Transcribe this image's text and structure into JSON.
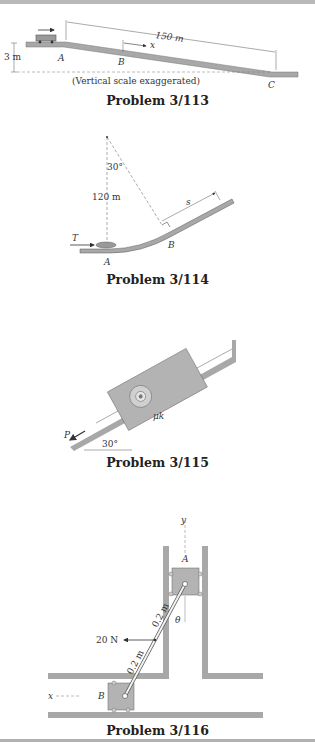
{
  "figures": [
    {
      "caption": "Problem 3/113",
      "labels": {
        "distance": "150 m",
        "height": "3 m",
        "x_axis": "x",
        "point_a": "A",
        "point_b": "B",
        "point_c": "C",
        "note": "(Vertical scale exaggerated)"
      }
    },
    {
      "caption": "Problem 3/114",
      "labels": {
        "angle": "30°",
        "radius": "120 m",
        "force": "T",
        "point_a": "A",
        "point_b": "B",
        "arc": "s"
      }
    },
    {
      "caption": "Problem 3/115",
      "labels": {
        "force": "P",
        "angle": "30°",
        "friction": "μk"
      }
    },
    {
      "caption": "Problem 3/116",
      "labels": {
        "y_axis": "y",
        "x_axis": "x",
        "point_a": "A",
        "point_b": "B",
        "angle": "θ",
        "force": "20 N",
        "link_upper": "0.2 m",
        "link_lower": "0.2 m"
      }
    }
  ],
  "colors": {
    "surface": "#a8a8a8",
    "block": "#b3b3b3",
    "line": "#444444"
  }
}
